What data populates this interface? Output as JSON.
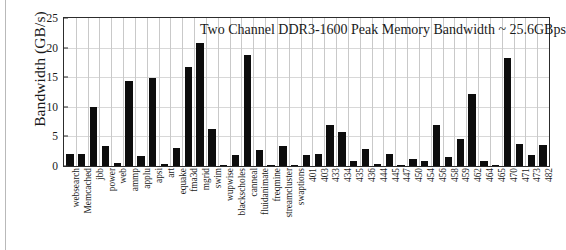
{
  "chart_data": {
    "type": "bar",
    "title": "Two Channel DDR3-1600 Peak Memory Bandwidth ~ 25.6GBps",
    "xlabel": "",
    "ylabel": "Bandwidth (GB/s)",
    "ylim": [
      0,
      25
    ],
    "yticks": [
      0,
      5,
      10,
      15,
      20,
      25
    ],
    "grid": "vertical-and-horizontal",
    "legend": "none",
    "bar_color": "#0d0d0d",
    "categories": [
      "websearch",
      "Memcached",
      "jbb",
      "power",
      "web",
      "ammp",
      "applu",
      "apsi",
      "art",
      "equake",
      "fma3d",
      "mgrid",
      "swim",
      "wupwise",
      "blackscholes",
      "canneal",
      "fluidanimate",
      "freqmine",
      "streamcluster",
      "swaptions",
      "401",
      "403",
      "433",
      "434",
      "435",
      "436",
      "444",
      "445",
      "447",
      "450",
      "454",
      "456",
      "458",
      "459",
      "462",
      "464",
      "465",
      "470",
      "471",
      "473",
      "482"
    ],
    "values": [
      2.0,
      2.0,
      9.9,
      3.4,
      0.5,
      14.3,
      1.7,
      14.9,
      0.3,
      3.0,
      16.8,
      20.7,
      6.2,
      0.05,
      1.9,
      18.7,
      2.7,
      0.05,
      3.4,
      0.05,
      1.9,
      2.0,
      6.9,
      5.7,
      0.9,
      2.9,
      0.3,
      2.0,
      0.2,
      1.2,
      0.8,
      6.9,
      1.5,
      4.5,
      12.2,
      0.9,
      0.2,
      18.2,
      3.8,
      1.9,
      3.5
    ]
  }
}
